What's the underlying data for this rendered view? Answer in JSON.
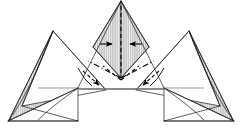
{
  "document": {
    "title": "Origami Fold Step Diagram",
    "type": "instructional-figure",
    "background_color": "#ffffff",
    "width": 242,
    "height": 137
  },
  "style": {
    "line_color": "#1a1a1a",
    "soft_line_color": "#555555",
    "thick_line_color": "#666666",
    "hatch_color": "#8a8a8a",
    "hatch_fill": "#f2f2f2",
    "paper_color": "#ffffff",
    "arrow_color": "#000000"
  },
  "figure": {
    "caption": "",
    "symmetry_axis_x": 121,
    "baseline_y": 122,
    "mid_band_y": 88
  },
  "shapes": {
    "hatched_panels": [
      {
        "name": "center-left-hatched-facet",
        "points": "121,1 93,47 121,78"
      },
      {
        "name": "center-right-hatched-facet",
        "points": "121,1 149,47 121,78"
      },
      {
        "name": "left-wing-hatched-facet",
        "points": "53,31 9,120 38,120 62,92"
      },
      {
        "name": "right-wing-hatched-facet",
        "points": "189,31 233,120 204,120 180,92"
      }
    ],
    "white_panels": [
      {
        "name": "left-inner-triangle",
        "points": "53,31 22,105 78,88"
      },
      {
        "name": "right-inner-triangle",
        "points": "189,31 220,105 164,88"
      },
      {
        "name": "center-peak-outline",
        "points": "121,1 78,88 164,88"
      }
    ],
    "edges": [
      {
        "name": "center-peak-left-edge",
        "d": "M121,1 L78,88"
      },
      {
        "name": "center-peak-right-edge",
        "d": "M121,1 L164,88"
      },
      {
        "name": "center-inner-left-edge",
        "d": "M121,1 L93,47"
      },
      {
        "name": "center-inner-right-edge",
        "d": "M121,1 L149,47"
      },
      {
        "name": "left-peak-left-edge",
        "d": "M53,31 L9,120"
      },
      {
        "name": "left-peak-right-edge",
        "d": "M53,31 L106,90"
      },
      {
        "name": "left-peak-inner-edge",
        "d": "M53,31 L22,106"
      },
      {
        "name": "right-peak-right-edge",
        "d": "M189,31 L233,120"
      },
      {
        "name": "right-peak-left-edge",
        "d": "M189,31 L136,90"
      },
      {
        "name": "right-peak-inner-edge",
        "d": "M189,31 L220,106"
      },
      {
        "name": "left-bottom-edge",
        "d": "M8,121 L78,121"
      },
      {
        "name": "right-bottom-edge",
        "d": "M164,121 L234,121"
      },
      {
        "name": "left-lower-fold",
        "d": "M78,88 L8,121"
      },
      {
        "name": "right-lower-fold",
        "d": "M164,88 L234,121"
      },
      {
        "name": "left-outer-curve",
        "d": "M53,31 Q30,90 9,120"
      },
      {
        "name": "right-outer-curve",
        "d": "M189,31 Q212,90 233,120"
      },
      {
        "name": "left-hatch-curve",
        "d": "M38,120 Q52,106 78,88"
      },
      {
        "name": "right-hatch-curve",
        "d": "M204,120 Q190,106 164,88"
      },
      {
        "name": "left-mid-horizontal",
        "d": "M38,88 L78,88"
      },
      {
        "name": "right-mid-horizontal",
        "d": "M164,88 L204,88"
      },
      {
        "name": "center-base-band",
        "d": "M78,89 L164,89"
      },
      {
        "name": "left-flap-diagonal",
        "d": "M78,88 L40,121"
      },
      {
        "name": "right-flap-diagonal",
        "d": "M164,88 L202,121"
      }
    ]
  },
  "fold_marks": {
    "valley_folds": [
      {
        "name": "center-vertical-valley-fold",
        "d": "M121,6 L121,78",
        "style": "dashed"
      },
      {
        "name": "left-diagonal-valley-fold",
        "d": "M121,78 L90,58",
        "style": "dashed"
      },
      {
        "name": "right-diagonal-valley-fold",
        "d": "M121,78 L152,58",
        "style": "dashed"
      }
    ],
    "mountain_folds": [
      {
        "name": "left-mountain-fold",
        "d": "M121,78 L88,62",
        "style": "dash-dot"
      },
      {
        "name": "right-mountain-fold",
        "d": "M121,78 L154,62",
        "style": "dash-dot"
      }
    ]
  },
  "annotations": {
    "arrows": [
      {
        "name": "arrow-push-left-inward",
        "direction": "right",
        "kind": "solid",
        "from": [
          101,
          44
        ],
        "to": [
          113,
          44
        ]
      },
      {
        "name": "arrow-push-right-inward",
        "direction": "left",
        "kind": "solid",
        "from": [
          141,
          44
        ],
        "to": [
          129,
          44
        ]
      },
      {
        "name": "arrow-fold-left-down",
        "direction": "down-right",
        "kind": "dashed",
        "from": [
          84,
          72
        ],
        "to": [
          99,
          86
        ]
      },
      {
        "name": "arrow-fold-right-down",
        "direction": "down-left",
        "kind": "dashed",
        "from": [
          158,
          72
        ],
        "to": [
          143,
          86
        ]
      }
    ],
    "rotation_arcs": [
      {
        "name": "left-fold-arc",
        "d": "M80,68 Q86,80 93,86"
      },
      {
        "name": "right-fold-arc",
        "d": "M162,68 Q156,80 149,86"
      }
    ]
  },
  "legend": {
    "valley_fold_label": "valley fold",
    "mountain_fold_label": "mountain fold",
    "arrow_label": "fold direction"
  }
}
